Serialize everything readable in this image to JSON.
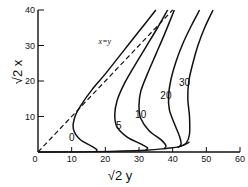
{
  "chart_data": {
    "type": "line",
    "title": "",
    "xlabel": "√2 y",
    "ylabel": "√2 x",
    "xlim": [
      0,
      60
    ],
    "ylim": [
      0,
      40
    ],
    "xticks": [
      0,
      10,
      20,
      30,
      40,
      50,
      60
    ],
    "yticks": [
      0,
      10,
      20,
      30,
      40
    ],
    "grid": false,
    "reference_line": {
      "label": "x=y",
      "style": "dashed",
      "points": [
        [
          0,
          0
        ],
        [
          40,
          40
        ]
      ]
    },
    "series": [
      {
        "name": "0",
        "label_at": [
          10,
          3.2
        ],
        "points": [
          [
            17,
            0
          ],
          [
            17.5,
            0.6
          ],
          [
            16,
            1.6
          ],
          [
            12.5,
            3.5
          ],
          [
            10.5,
            6.5
          ],
          [
            11,
            10
          ],
          [
            13,
            13.5
          ],
          [
            16,
            17.5
          ],
          [
            20,
            22
          ],
          [
            25,
            28
          ],
          [
            30,
            34
          ],
          [
            35,
            40
          ]
        ]
      },
      {
        "name": "5",
        "label_at": [
          24,
          6.5
        ],
        "points": [
          [
            32,
            0.5
          ],
          [
            32.5,
            1.2
          ],
          [
            30.5,
            2.3
          ],
          [
            26.5,
            4.2
          ],
          [
            23.5,
            7
          ],
          [
            22.8,
            10.5
          ],
          [
            23.5,
            14.5
          ],
          [
            25.5,
            19
          ],
          [
            28.5,
            24
          ],
          [
            32,
            29.5
          ],
          [
            35.5,
            35
          ],
          [
            38.5,
            40
          ]
        ]
      },
      {
        "name": "10",
        "label_at": [
          30.5,
          9.5
        ],
        "points": [
          [
            37.5,
            1
          ],
          [
            38,
            1.8
          ],
          [
            36.5,
            3.5
          ],
          [
            33,
            6
          ],
          [
            30.5,
            9.5
          ],
          [
            30,
            13
          ],
          [
            30.5,
            17
          ],
          [
            32.5,
            22
          ],
          [
            35,
            27.5
          ],
          [
            37.5,
            33
          ],
          [
            40.5,
            40
          ]
        ]
      },
      {
        "name": "20",
        "label_at": [
          38,
          15
        ],
        "points": [
          [
            41.5,
            1.2
          ],
          [
            42.5,
            2.2
          ],
          [
            42,
            4.5
          ],
          [
            40.5,
            8
          ],
          [
            39,
            12
          ],
          [
            38.8,
            16
          ],
          [
            39.5,
            20.5
          ],
          [
            41,
            25.5
          ],
          [
            43,
            30.5
          ],
          [
            45.5,
            35.5
          ],
          [
            48,
            40
          ]
        ]
      },
      {
        "name": "30",
        "label_at": [
          43.5,
          18.5
        ],
        "points": [
          [
            42,
            1.5
          ],
          [
            44,
            2.5
          ],
          [
            45,
            5
          ],
          [
            45,
            10
          ],
          [
            44.5,
            15
          ],
          [
            44.8,
            20
          ],
          [
            46,
            25
          ],
          [
            47.5,
            30
          ],
          [
            49.5,
            35
          ],
          [
            52,
            40
          ]
        ]
      }
    ],
    "baseline": {
      "points": [
        [
          0,
          0
        ],
        [
          17,
          0.1
        ],
        [
          32,
          0.5
        ],
        [
          38,
          1
        ],
        [
          42,
          1.5
        ],
        [
          45,
          2.8
        ]
      ]
    }
  }
}
